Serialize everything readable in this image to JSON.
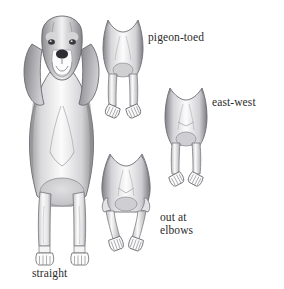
{
  "illustration": {
    "title": "Dog front leg conformation diagram",
    "background_color": "#ffffff",
    "ink_color": "#2b2b2b",
    "shading_colors": {
      "dark_gray": "#6e6e70",
      "mid_gray": "#9a9a9c",
      "light_gray": "#c9c9cb",
      "pale_gray": "#e6e6e8",
      "outline": "#55555a"
    },
    "subject": "hound dog (beagle-type), front view"
  },
  "labels": [
    {
      "id": "pigeon-toed",
      "text": "pigeon-toed",
      "x": 148,
      "y": 31,
      "lines": [
        "pigeon-toed"
      ]
    },
    {
      "id": "east-west",
      "text": "east-west",
      "x": 212,
      "y": 96,
      "lines": [
        "east-west"
      ]
    },
    {
      "id": "out-at-elbows",
      "text": "out at elbows",
      "x": 160,
      "y": 211,
      "lines": [
        "out at",
        "elbows"
      ]
    },
    {
      "id": "straight",
      "text": "straight",
      "x": 32,
      "y": 267,
      "lines": [
        "straight"
      ]
    }
  ],
  "figures": [
    {
      "id": "main-dog-straight",
      "name": "full body hound dog standing straight",
      "label_ref": "straight",
      "x": 8,
      "y": 12,
      "width": 108,
      "height": 253,
      "description": "Full front view of a hound with droopy ears, straight front legs, feet pointing forward"
    },
    {
      "id": "pigeon-toed-legs",
      "name": "front legs pigeon-toed",
      "label_ref": "pigeon-toed",
      "x": 96,
      "y": 14,
      "width": 54,
      "height": 104,
      "description": "Front view of chest and legs with both feet turned inward toward each other"
    },
    {
      "id": "east-west-legs",
      "name": "front legs east-west",
      "label_ref": "east-west",
      "x": 158,
      "y": 82,
      "width": 56,
      "height": 104,
      "description": "Front view of chest and legs with both feet turned outward"
    },
    {
      "id": "out-at-elbows-legs",
      "name": "front legs out at elbows",
      "label_ref": "out-at-elbows",
      "x": 97,
      "y": 148,
      "width": 58,
      "height": 104,
      "description": "Front view with elbows bowed outward and lower legs angling inward then feet out"
    }
  ]
}
